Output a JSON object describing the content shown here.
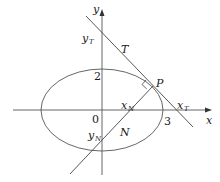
{
  "diagram": {
    "type": "ellipse-tangent-normal",
    "axes": {
      "x_label": "x",
      "y_label": "y",
      "origin_label": "0"
    },
    "ellipse": {
      "x_intercept_label": "3",
      "y_intercept_label": "2"
    },
    "labels": {
      "point": "P",
      "tangent": "T",
      "normal": "N",
      "yT_main": "y",
      "yT_sub": "T",
      "xT_main": "x",
      "xT_sub": "T",
      "xN_main": "x",
      "xN_sub": "N",
      "yN_main": "y",
      "yN_sub": "N"
    },
    "colors": {
      "stroke": "#3a3a3a",
      "text": "#1a1a1a",
      "background": "#ffffff"
    }
  }
}
